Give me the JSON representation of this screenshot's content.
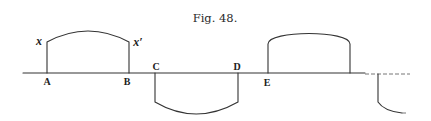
{
  "figure": {
    "caption": "Fig. 48.",
    "point_labels": {
      "A": "A",
      "B": "B",
      "C": "C",
      "D": "D",
      "E": "E"
    },
    "curve_labels": {
      "x": "x",
      "x_prime": "x′"
    },
    "ink_color": "#333333",
    "background_color": "#ffffff"
  }
}
